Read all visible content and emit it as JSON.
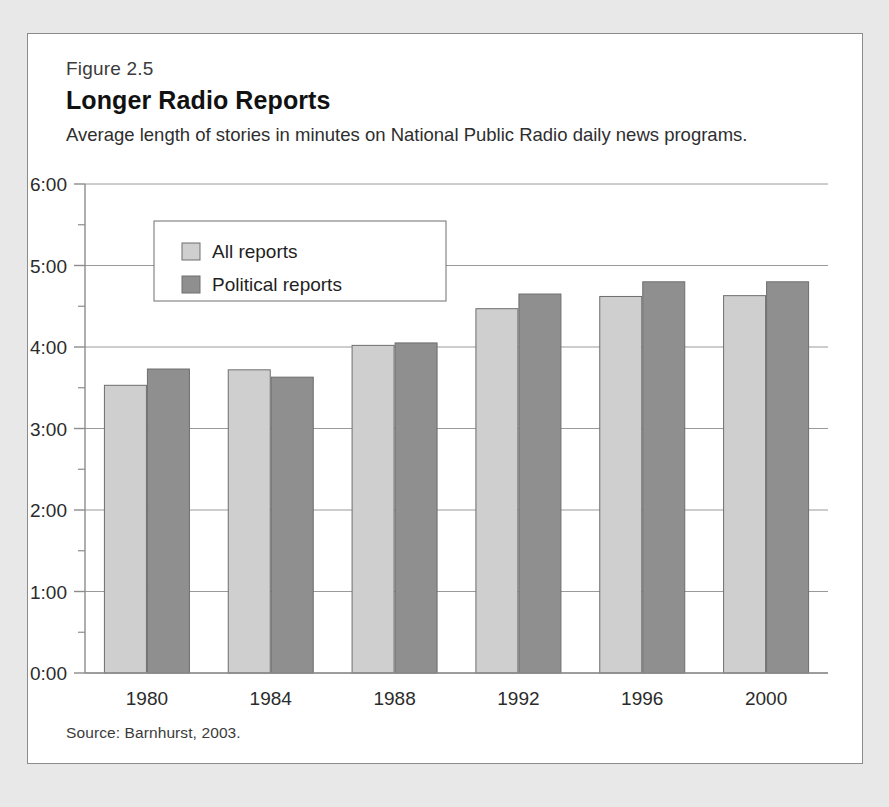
{
  "figure": {
    "number": "Figure 2.5",
    "title": "Longer Radio Reports",
    "subtitle": "Average length of stories in minutes on National Public Radio daily news programs.",
    "source": "Source: Barnhurst, 2003."
  },
  "colors": {
    "series_all": "#cfcfcf",
    "series_political": "#8f8f8f",
    "bar_outline": "#6e6e6e",
    "gridline": "#9a9a9a",
    "axis": "#8c8c8c",
    "frame": "#8c8c8c",
    "page_background": "#e8e8e8",
    "figure_background": "#ffffff",
    "text": "#2b2b2b"
  },
  "legend": {
    "position": "upper-left-inside",
    "entries": [
      {
        "label": "All reports",
        "color": "#cfcfcf"
      },
      {
        "label": "Political reports",
        "color": "#8f8f8f"
      }
    ]
  },
  "chart_data": {
    "type": "bar",
    "title": "Longer Radio Reports",
    "subtitle": "Average length of stories in minutes on National Public Radio daily news programs.",
    "xlabel": "",
    "ylabel": "",
    "categories": [
      "1980",
      "1984",
      "1988",
      "1992",
      "1996",
      "2000"
    ],
    "series": [
      {
        "name": "All reports",
        "values": [
          3.53,
          3.72,
          4.02,
          4.47,
          4.62,
          4.63
        ],
        "value_labels": [
          "3:32",
          "3:43",
          "4:01",
          "4:28",
          "4:37",
          "4:38"
        ]
      },
      {
        "name": "Political reports",
        "values": [
          3.73,
          3.63,
          4.05,
          4.65,
          4.8,
          4.8
        ],
        "value_labels": [
          "3:44",
          "3:38",
          "4:03",
          "4:39",
          "4:48",
          "4:48"
        ]
      }
    ],
    "ylim": [
      0,
      6
    ],
    "y_tick_values": [
      0,
      1,
      2,
      3,
      4,
      5,
      6
    ],
    "y_tick_labels": [
      "0:00",
      "1:00",
      "2:00",
      "3:00",
      "4:00",
      "5:00",
      "6:00"
    ],
    "y_minor_tick_values": [
      0.5,
      1.5,
      2.5,
      3.5,
      4.5,
      5.5
    ],
    "grid": true,
    "legend_position": "upper left",
    "units": "minutes:seconds"
  }
}
